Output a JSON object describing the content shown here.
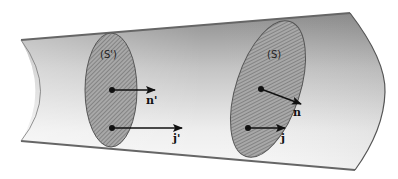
{
  "figure": {
    "colors": {
      "background": "#ffffff",
      "tube_dark": "#8e8e8e",
      "tube_light": "#f4f4f4",
      "tube_edge": "#555555",
      "section_fill": "#9a9a9a",
      "hatch": "#6a6a6a",
      "arrow": "#111111"
    },
    "sections": [
      {
        "id": "S_prime",
        "label": "(S')",
        "normal_label": "n'",
        "current_label": "j'"
      },
      {
        "id": "S",
        "label": "(S)",
        "normal_label": "n",
        "current_label": "j"
      }
    ]
  }
}
